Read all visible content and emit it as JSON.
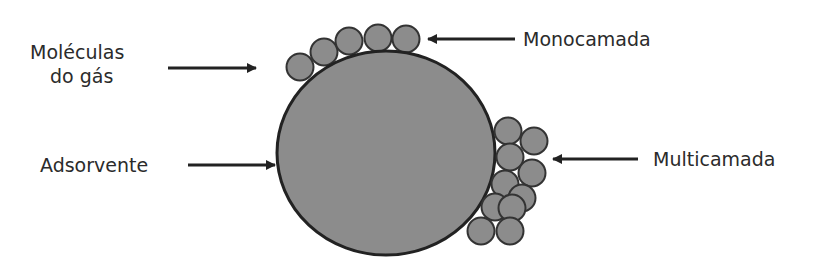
{
  "diagram": {
    "title": "",
    "labels": {
      "gas_molecules_line1": "Moléculas",
      "gas_molecules_line2": "do gás",
      "adsorbent": "Adsorvente",
      "monolayer": "Monocamada",
      "multilayer": "Multicamada"
    },
    "colors": {
      "fill": "#8c8c8c",
      "stroke": "#222222",
      "text": "#2b2b2b"
    },
    "adsorbent_circle": {
      "cx": 386,
      "cy": 153,
      "rx": 109,
      "ry": 102
    },
    "monolayer_molecules": [
      {
        "cx": 300,
        "cy": 67
      },
      {
        "cx": 324,
        "cy": 52
      },
      {
        "cx": 349,
        "cy": 41
      },
      {
        "cx": 378,
        "cy": 38
      },
      {
        "cx": 406,
        "cy": 39
      }
    ],
    "multilayer_molecules": [
      {
        "cx": 508,
        "cy": 131
      },
      {
        "cx": 534,
        "cy": 141
      },
      {
        "cx": 510,
        "cy": 157
      },
      {
        "cx": 532,
        "cy": 173
      },
      {
        "cx": 505,
        "cy": 184
      },
      {
        "cx": 522,
        "cy": 198
      },
      {
        "cx": 495,
        "cy": 207
      },
      {
        "cx": 512,
        "cy": 208
      },
      {
        "cx": 481,
        "cy": 231
      },
      {
        "cx": 510,
        "cy": 231
      }
    ]
  }
}
